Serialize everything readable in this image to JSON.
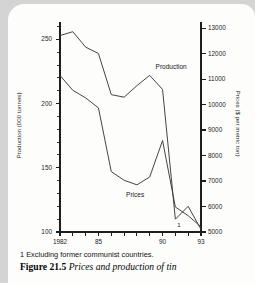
{
  "figure": {
    "footnote": "1 Excluding former communist countries.",
    "number": "Figure 21.5",
    "title": "Prices and production of tin",
    "footnote_marker": "1"
  },
  "chart_data": {
    "type": "line",
    "title": "Prices and production of tin",
    "xlabel": "",
    "ylabel": "Production (000 tonnes)",
    "y2label": "Prices ($ per metric ton)",
    "grid": false,
    "legend": "inline-annotations",
    "x": [
      1982,
      1983,
      1984,
      1985,
      1986,
      1987,
      1988,
      1989,
      1990,
      1991,
      1992,
      1993
    ],
    "x_tick_values": [
      1982,
      1983,
      1984,
      1985,
      1986,
      1987,
      1988,
      1989,
      1990,
      1991,
      1992,
      1993
    ],
    "x_tick_labels": [
      "1982",
      "",
      "",
      "85",
      "",
      "",
      "",
      "",
      "90",
      "",
      "",
      "93"
    ],
    "xlim": [
      1982,
      1993
    ],
    "ylim": [
      100,
      262
    ],
    "y_tick_values": [
      100,
      150,
      200,
      250
    ],
    "y_tick_labels": [
      "100",
      "150",
      "200",
      "250"
    ],
    "y_minor_step": 10,
    "y2lim": [
      5000,
      13160
    ],
    "y2_tick_values": [
      5000,
      6000,
      7000,
      8000,
      9000,
      10000,
      11000,
      12000,
      13000
    ],
    "y2_tick_labels": [
      "5000",
      "6000",
      "7000",
      "8000",
      "9000",
      "10000",
      "11000",
      "12000",
      "13000"
    ],
    "series": [
      {
        "name": "Production",
        "axis": "left",
        "units": "000 tonnes",
        "label_text": "Production",
        "values": [
          253,
          256,
          244,
          239,
          207,
          205,
          214,
          222,
          211,
          110,
          120,
          102
        ]
      },
      {
        "name": "Prices",
        "axis": "right",
        "units": "$ per metric ton",
        "label_text": "Prices",
        "values": [
          11140,
          10560,
          10260,
          9870,
          7370,
          7030,
          6850,
          7160,
          8590,
          5980,
          5640,
          5200
        ]
      }
    ],
    "annotations": [
      {
        "text": "Production",
        "x": 1989.3,
        "y": 228
      },
      {
        "text": "Prices",
        "x": 1987.0,
        "y": 128
      },
      {
        "text": "1",
        "x": 1991.0,
        "y": 104
      }
    ]
  },
  "axes": {
    "left_title": "Production (000 tonnes)",
    "right_title": "Prices ($ per metric ton)"
  }
}
